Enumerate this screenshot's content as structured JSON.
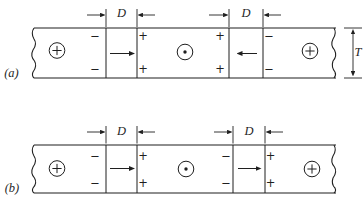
{
  "figure": {
    "ink_color": "#1f1f1f",
    "background_color": "#ffffff"
  },
  "panel_a": {
    "label": "(a)",
    "dim1_label": "D",
    "dim2_label": "D",
    "thickness_label": "T",
    "domains": [
      "circled-plus",
      "circled-dot",
      "circled-plus"
    ],
    "wall1": {
      "arrow_direction": "right",
      "left_top": "−",
      "left_bottom": "−",
      "right_top": "+",
      "right_bottom": "+"
    },
    "wall2": {
      "arrow_direction": "left",
      "left_top": "+",
      "left_bottom": "+",
      "right_top": "−",
      "right_bottom": "−"
    }
  },
  "panel_b": {
    "label": "(b)",
    "dim1_label": "D",
    "dim2_label": "D",
    "domains": [
      "circled-plus",
      "circled-dot",
      "circled-plus"
    ],
    "wall1": {
      "arrow_direction": "right",
      "left_top": "−",
      "left_bottom": "−",
      "right_top": "+",
      "right_bottom": "+"
    },
    "wall2": {
      "arrow_direction": "right",
      "left_top": "−",
      "left_bottom": "−",
      "right_top": "+",
      "right_bottom": "+"
    }
  }
}
